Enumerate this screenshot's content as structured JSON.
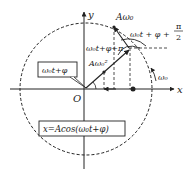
{
  "diagram": {
    "axes": {
      "x_label": "x",
      "y_label": "y",
      "origin_label": "O"
    },
    "labels": {
      "phase_box": "ω₀t+φ",
      "position_box": "x=Acos(ω₀t+φ)",
      "velocity": "Aω₀",
      "acceleration": "Aω₀²",
      "accel_phase": "ω₀t+φ+π",
      "velocity_phase_main": "ω₀t + φ +",
      "velocity_phase_num": "π",
      "velocity_phase_den": "2",
      "angular_velocity": "ω₀"
    },
    "colors": {
      "ink": "#222222",
      "background": "#ffffff"
    }
  }
}
